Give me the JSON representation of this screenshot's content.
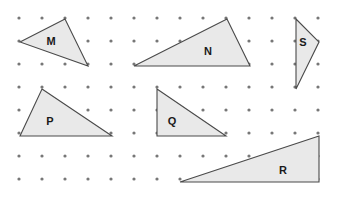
{
  "figure": {
    "width": 337,
    "height": 200,
    "background_color": "#ffffff",
    "dot_color": "#777777",
    "triangle_fill_color": "#e9e9e9",
    "triangle_stroke_color": "#4a4a4a",
    "label_color": "#1a1a1a"
  },
  "grid": {
    "columns": 14,
    "rows": 8,
    "spacing_px": 23,
    "origin_x": 19,
    "origin_y": 18,
    "dot_radius_px": 1.6
  },
  "shapes": [
    {
      "label": "M",
      "label_x": 51,
      "label_y": 42,
      "points": "20,42 65,19 88,66",
      "vertices": [
        [
          20,
          42
        ],
        [
          65,
          19
        ],
        [
          88,
          66
        ]
      ]
    },
    {
      "label": "N",
      "label_x": 208,
      "label_y": 52,
      "points": "134,66 227,19 250,66",
      "vertices": [
        [
          134,
          66
        ],
        [
          227,
          19
        ],
        [
          250,
          66
        ]
      ]
    },
    {
      "label": "S",
      "label_x": 303,
      "label_y": 43,
      "points": "296,19 319,42 296,89",
      "vertices": [
        [
          296,
          19
        ],
        [
          319,
          42
        ],
        [
          296,
          89
        ]
      ]
    },
    {
      "label": "P",
      "label_x": 50,
      "label_y": 122,
      "points": "42,89 112,136 20,136",
      "vertices": [
        [
          42,
          89
        ],
        [
          112,
          136
        ],
        [
          20,
          136
        ]
      ]
    },
    {
      "label": "Q",
      "label_x": 172,
      "label_y": 122,
      "points": "157,89 226,136 157,136",
      "vertices": [
        [
          157,
          89
        ],
        [
          226,
          136
        ],
        [
          157,
          136
        ]
      ]
    },
    {
      "label": "R",
      "label_x": 283,
      "label_y": 171,
      "points": "319,136 319,182 180,182",
      "vertices": [
        [
          319,
          136
        ],
        [
          319,
          182
        ],
        [
          180,
          182
        ]
      ]
    }
  ]
}
